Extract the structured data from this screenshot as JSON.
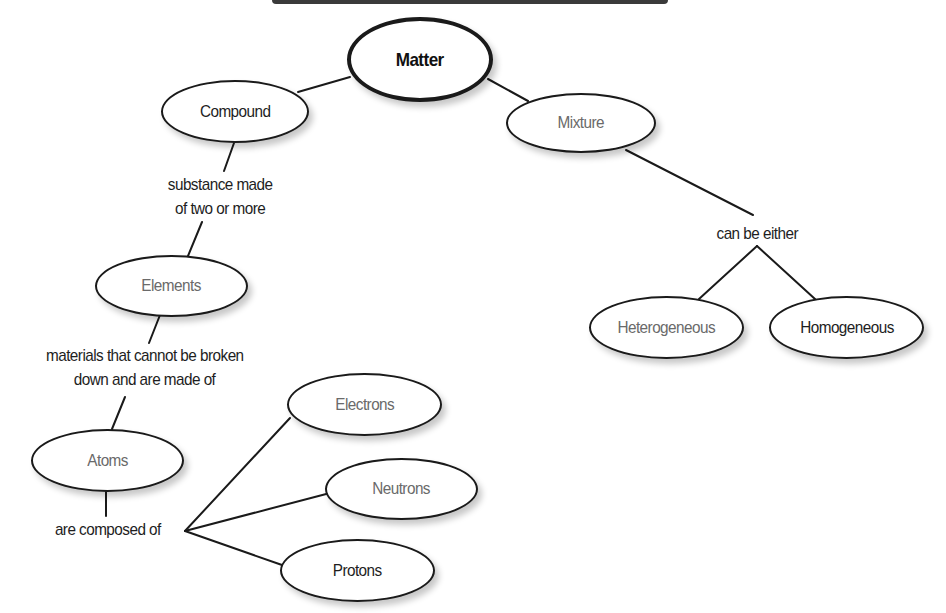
{
  "diagram": {
    "type": "concept-map",
    "root": {
      "label": "Matter"
    },
    "nodes": {
      "matter": {
        "label": "Matter",
        "color": "#111111"
      },
      "compound": {
        "label": "Compound",
        "color": "#1e1e1e"
      },
      "mixture": {
        "label": "Mixture",
        "color": "#6a6a6a"
      },
      "elements": {
        "label": "Elements",
        "color": "#6a6a6a"
      },
      "atoms": {
        "label": "Atoms",
        "color": "#6a6a6a"
      },
      "electrons": {
        "label": "Electrons",
        "color": "#6a6a6a"
      },
      "neutrons": {
        "label": "Neutrons",
        "color": "#6a6a6a"
      },
      "protons": {
        "label": "Protons",
        "color": "#1e1e1e"
      },
      "heterogeneous": {
        "label": "Heterogeneous",
        "color": "#6a6a6a"
      },
      "homogeneous": {
        "label": "Homogeneous",
        "color": "#1e1e1e"
      }
    },
    "links": {
      "compound_elements": {
        "line1": "substance made",
        "line2": "of two or more"
      },
      "elements_atoms": {
        "line1": "materials that cannot be broken",
        "line2": "down and are made of"
      },
      "atoms_particles": {
        "text": "are composed of"
      },
      "mixture_types": {
        "text": "can be either"
      }
    },
    "edges": [
      [
        "Matter",
        "Compound"
      ],
      [
        "Matter",
        "Mixture"
      ],
      [
        "Compound",
        "substance made of two or more"
      ],
      [
        "substance made of two or more",
        "Elements"
      ],
      [
        "Elements",
        "materials that cannot be broken down and are made of"
      ],
      [
        "materials that cannot be broken down and are made of",
        "Atoms"
      ],
      [
        "Atoms",
        "are composed of"
      ],
      [
        "are composed of",
        "Electrons"
      ],
      [
        "are composed of",
        "Neutrons"
      ],
      [
        "are composed of",
        "Protons"
      ],
      [
        "Mixture",
        "can be either"
      ],
      [
        "can be either",
        "Heterogeneous"
      ],
      [
        "can be either",
        "Homogeneous"
      ]
    ]
  }
}
